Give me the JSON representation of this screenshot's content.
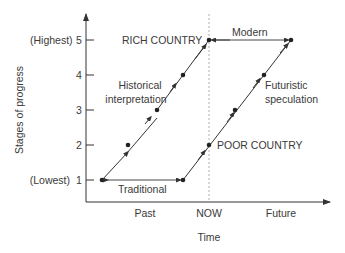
{
  "diagram": {
    "y_axis": {
      "title": "Stages of progress",
      "ticks": [
        {
          "value": "5",
          "qualifier": "(Highest)"
        },
        {
          "value": "4",
          "qualifier": ""
        },
        {
          "value": "3",
          "qualifier": ""
        },
        {
          "value": "2",
          "qualifier": ""
        },
        {
          "value": "1",
          "qualifier": "(Lowest)"
        }
      ]
    },
    "x_axis": {
      "title": "Time",
      "categories": [
        "Past",
        "NOW",
        "Future"
      ]
    },
    "labels": {
      "rich_country": "RICH COUNTRY",
      "poor_country": "POOR COUNTRY",
      "modern": "Modern",
      "traditional": "Traditional",
      "historical_line1": "Historical",
      "historical_line2": "interpretation",
      "futuristic_line1": "Futuristic",
      "futuristic_line2": "speculation"
    },
    "colors": {
      "line": "#333333",
      "dashed": "#999999",
      "text": "#3a3a3a"
    }
  }
}
